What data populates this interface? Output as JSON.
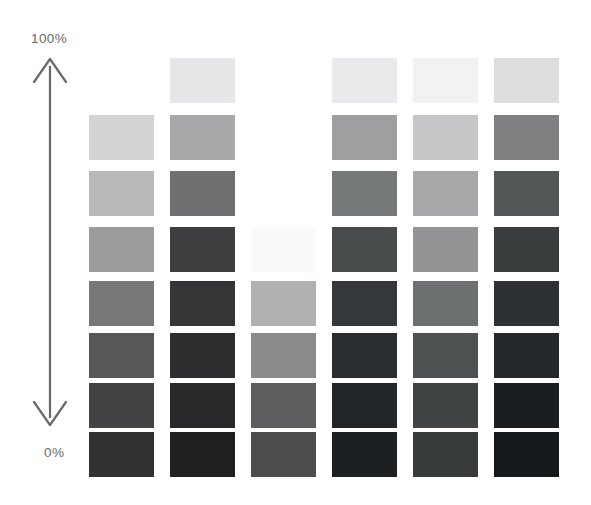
{
  "axis": {
    "top_label": "100%",
    "bottom_label": "0%",
    "arrow_color": "#6a6a6a",
    "label_color": "#6a6a6a",
    "direction": "double-headed-vertical"
  },
  "background_color": "#ffffff",
  "chart_data": {
    "type": "heatmap",
    "title": "",
    "xlabel": "",
    "ylabel": "",
    "grid": false,
    "legend": "none",
    "columns": 6,
    "rows": 8,
    "row_scale_percent": [
      100,
      86,
      71,
      57,
      43,
      29,
      14,
      0
    ],
    "geometry": {
      "column_x": [
        89,
        170,
        251,
        332,
        413,
        494
      ],
      "row_y": [
        58,
        115,
        171,
        227,
        281,
        333,
        383,
        432
      ],
      "swatch_width": 65,
      "swatch_height": 45
    },
    "series": [
      {
        "name": "Column 1",
        "values": [
          null,
          "#d2d3d2",
          "#b8b9b8",
          "#9b9c9c",
          "#767878",
          "#565858",
          "#414344",
          "#313233"
        ]
      },
      {
        "name": "Column 2",
        "values": [
          "#e6e7e8",
          "#a8a9aa",
          "#6e7071",
          "#3c3e3f",
          "#333536",
          "#2b2d2e",
          "#26282a",
          "#1f2123"
        ]
      },
      {
        "name": "Column 3",
        "values": [
          null,
          null,
          null,
          "#fafafa",
          "#b0b2b2",
          "#8a8c8c",
          "#5b5d5e",
          "#4b4d4e"
        ]
      },
      {
        "name": "Column 4",
        "values": [
          "#e9eaeb",
          "#9d9fa0",
          "#76797a",
          "#494c4d",
          "#35383a",
          "#2b2e30",
          "#232628",
          "#1d2022"
        ]
      },
      {
        "name": "Column 5",
        "values": [
          "#f1f2f2",
          "#c6c7c8",
          "#a6a8a9",
          "#929495",
          "#6d7071",
          "#4f5253",
          "#414445",
          "#383b3c"
        ]
      },
      {
        "name": "Column 6",
        "values": [
          "#dcdddd",
          "#7e8081",
          "#545758",
          "#3a3d3e",
          "#2e3133",
          "#25282a",
          "#1b1e20",
          "#16191b"
        ]
      }
    ]
  }
}
